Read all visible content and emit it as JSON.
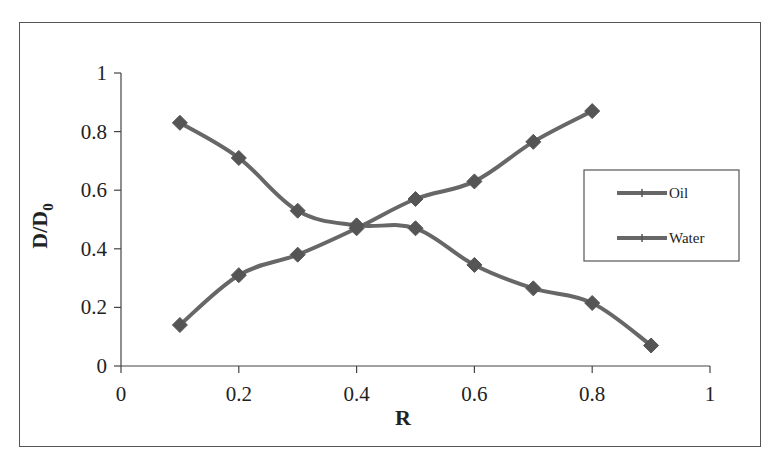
{
  "chart_data": {
    "type": "line",
    "title": "",
    "xlabel": "R",
    "ylabel": "D/D0",
    "ylabel_main": "D/D",
    "ylabel_sub": "0",
    "xlim": [
      0,
      1
    ],
    "ylim": [
      0,
      1
    ],
    "x_ticks": [
      "0",
      "0.2",
      "0.4",
      "0.6",
      "0.8",
      "1"
    ],
    "y_ticks": [
      "0",
      "0.2",
      "0.4",
      "0.6",
      "0.8",
      "1"
    ],
    "grid": false,
    "legend_position": "right, inside plot, mid-height",
    "smoothed": true,
    "marker": "diamond",
    "series": [
      {
        "name": "Oil",
        "x": [
          0.1,
          0.2,
          0.3,
          0.4,
          0.5,
          0.6,
          0.7,
          0.8
        ],
        "values": [
          0.14,
          0.31,
          0.38,
          0.47,
          0.57,
          0.63,
          0.765,
          0.87
        ]
      },
      {
        "name": "Water",
        "x": [
          0.1,
          0.2,
          0.3,
          0.4,
          0.5,
          0.6,
          0.7,
          0.8,
          0.9
        ],
        "values": [
          0.83,
          0.71,
          0.53,
          0.48,
          0.47,
          0.345,
          0.265,
          0.215,
          0.07
        ]
      }
    ]
  },
  "colors": {
    "line": "#676767",
    "marker": "#555555",
    "axis": "#444444",
    "frame": "#555555"
  },
  "legend": {
    "items": [
      {
        "label": "Oil"
      },
      {
        "label": "Water"
      }
    ]
  }
}
